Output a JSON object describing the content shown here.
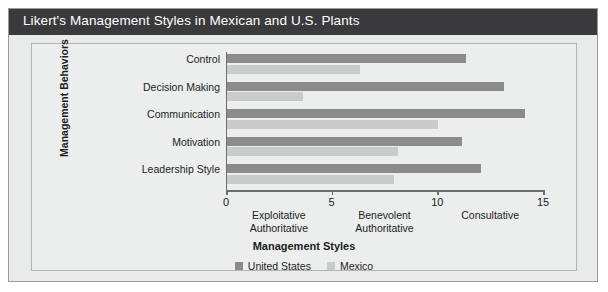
{
  "title": "Likert's Management Styles in Mexican and U.S. Plants",
  "legend": {
    "items": [
      {
        "label": "United States",
        "color": "#8b8b8b"
      },
      {
        "label": "Mexico",
        "color": "#c9cacb"
      }
    ]
  },
  "axes": {
    "y_title": "Management Behaviors",
    "x_title": "Management Styles"
  },
  "chart_data": {
    "type": "bar",
    "orientation": "horizontal",
    "title": "Likert's Management Styles in Mexican and U.S. Plants",
    "xlabel": "Management Styles",
    "ylabel": "Management Behaviors",
    "categories": [
      "Control",
      "Decision Making",
      "Communication",
      "Motivation",
      "Leadership Style"
    ],
    "series": [
      {
        "name": "United States",
        "color": "#8b8b8b",
        "values": [
          11.3,
          13.1,
          14.1,
          11.1,
          12.0
        ]
      },
      {
        "name": "Mexico",
        "color": "#c9cacb",
        "values": [
          6.3,
          3.6,
          10.0,
          8.1,
          7.9
        ]
      }
    ],
    "xlim": [
      0,
      15
    ],
    "xticks": [
      0,
      5,
      10,
      15
    ],
    "xtick_labels": [
      "0",
      "5",
      "10",
      "15"
    ],
    "x_style_bands": [
      {
        "label_line1": "Exploitative",
        "label_line2": "Authoritative",
        "center": 2.5
      },
      {
        "label_line1": "Benevolent",
        "label_line2": "Authoritative",
        "center": 7.5
      },
      {
        "label_line1": "Consultative",
        "label_line2": "",
        "center": 12.5
      }
    ],
    "grid": false,
    "legend_position": "bottom"
  }
}
